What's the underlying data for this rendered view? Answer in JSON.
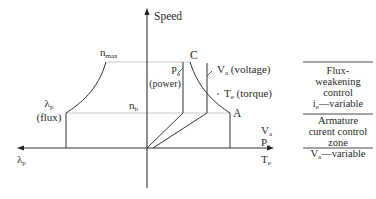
{
  "diagram": {
    "axes": {
      "y_label": "Speed",
      "x_right_label_top": "V",
      "x_right_label_top_sub": "a",
      "x_right_label_mid": "P",
      "x_right_label_mid_sub": "e",
      "x_right_label_bot": "T",
      "x_right_label_bot_sub": "e",
      "x_left_label": "λ",
      "x_left_label_sub": "p"
    },
    "speed_levels": {
      "max": {
        "label": "n",
        "sub": "max"
      },
      "base": {
        "label": "n",
        "sub": "b"
      }
    },
    "curves": {
      "flux": {
        "symbol": "λ",
        "sub": "p",
        "desc": "(flux)"
      },
      "power": {
        "symbol": "P",
        "sub": "e",
        "desc": "(power)"
      },
      "voltage": {
        "symbol": "V",
        "sub": "a",
        "desc": "(voltage)"
      },
      "torque": {
        "symbol": "T",
        "sub": "e",
        "desc": "(torque)"
      }
    },
    "points": {
      "C": "C",
      "A": "A"
    },
    "zones": {
      "upper": {
        "line1": "Flux-",
        "line2": "weakening",
        "line3": "control",
        "line4_main": "i",
        "line4_sub": "e",
        "line4_rest": "—variable"
      },
      "lower": {
        "line1": "Armature",
        "line2": "curent control zone",
        "line3_main": "V",
        "line3_sub": "a",
        "line3_rest": "—variable"
      }
    }
  }
}
